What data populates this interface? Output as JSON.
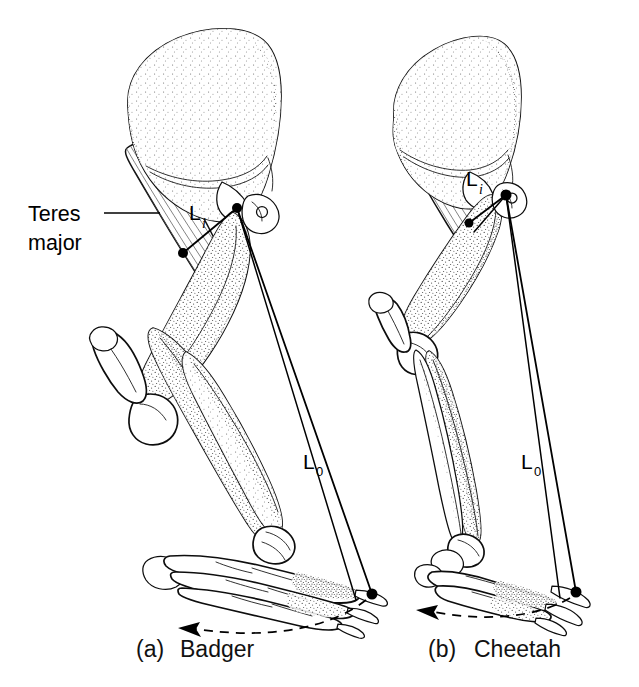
{
  "figure": {
    "kind": "anatomical-diagram",
    "background_color": "#ffffff",
    "ink_color": "#000000",
    "muscle_fiber_color": "#6d6d6d"
  },
  "annotations": {
    "teres_major": {
      "line1": "Teres",
      "line2": "major"
    }
  },
  "panels": [
    {
      "id": "panel-a",
      "caption_index": "(a)",
      "caption_name": "Badger",
      "animal": "Badger",
      "posture": "plantigrade",
      "in_lever_label": {
        "base": "L",
        "subscript": "i"
      },
      "out_lever_label": {
        "base": "L",
        "subscript": "0"
      },
      "has_teres_major_callout": true,
      "motion_arrow": "dashed-arc-left"
    },
    {
      "id": "panel-b",
      "caption_index": "(b)",
      "caption_name": "Cheetah",
      "animal": "Cheetah",
      "posture": "digitigrade",
      "in_lever_label": {
        "base": "L",
        "subscript": "i"
      },
      "out_lever_label": {
        "base": "L",
        "subscript": "0"
      },
      "has_teres_major_callout": false,
      "motion_arrow": "dashed-arc-left"
    }
  ]
}
